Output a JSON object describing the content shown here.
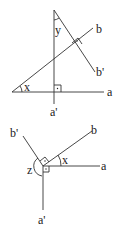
{
  "figure_top": {
    "labels": {
      "a": "a",
      "a_prime": "a'",
      "b": "b",
      "b_prime": "b'",
      "x": "x",
      "y": "y"
    },
    "right_angles": [
      "a ⟂ a'",
      "b ⟂ b'"
    ]
  },
  "figure_bottom": {
    "labels": {
      "a": "a",
      "a_prime": "a'",
      "b": "b",
      "b_prime": "b'",
      "x": "x",
      "z": "z"
    },
    "right_angles": [
      "a ⟂ a'",
      "b ⟂ b'"
    ]
  }
}
